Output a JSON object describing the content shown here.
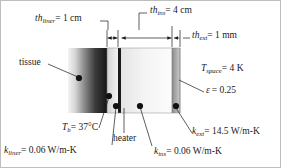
{
  "figure": {
    "type": "engineering-cross-section-diagram",
    "background_color": "#ffffff",
    "line_color": "#1a1a1a"
  },
  "layers": [
    {
      "name": "tissue",
      "label": "tissue",
      "x0": 68,
      "x1": 107,
      "fill_from": "#f2f2f2",
      "fill_to": "#1c1c1c"
    },
    {
      "name": "liner",
      "label": "liner",
      "x0": 107,
      "x1": 118,
      "fill_from": "#d9d9d9",
      "fill_to": "#efefef"
    },
    {
      "name": "heater",
      "label": "heater",
      "x0": 118,
      "x1": 121,
      "fill_from": "#191919",
      "fill_to": "#191919"
    },
    {
      "name": "insulation",
      "label": "ins",
      "x0": 121,
      "x1": 172,
      "fill_from": "#e8e8e8",
      "fill_to": "#fafafa"
    },
    {
      "name": "exterior",
      "label": "ext",
      "x0": 172,
      "x1": 180,
      "fill_from": "#8f8f8f",
      "fill_to": "#c9c9c9"
    }
  ],
  "dimensions": {
    "liner": {
      "symbol": "th",
      "subscript": "liner",
      "equals": "= 1 cm",
      "full_text": "th_liner = 1 cm"
    },
    "ins": {
      "symbol": "th",
      "subscript": "ins",
      "equals": "= 4 cm",
      "full_text": "th_ins = 4 cm"
    },
    "ext": {
      "symbol": "th",
      "subscript": "ext",
      "equals": "= 1 mm",
      "full_text": "th_ext = 1 mm"
    }
  },
  "callouts": {
    "tissue": {
      "text": "tissue"
    },
    "heater": {
      "text": "heater"
    },
    "body_temperature": {
      "symbol": "T",
      "subscript": "b",
      "equals": "= 37°C",
      "full_text": "T_b = 37°C"
    },
    "space_temperature": {
      "symbol": "T",
      "subscript": "space",
      "equals": "= 4 K",
      "full_text": "T_space = 4 K"
    },
    "emissivity": {
      "symbol": "ε",
      "subscript": "",
      "equals": "= 0.25",
      "full_text": "ε = 0.25"
    },
    "k_liner": {
      "symbol": "k",
      "subscript": "liner",
      "equals": "= 0.06 W/m-K",
      "full_text": "k_liner = 0.06 W/m-K"
    },
    "k_ins": {
      "symbol": "k",
      "subscript": "ins",
      "equals": "= 0.06 W/m-K",
      "full_text": "k_ins = 0.06 W/m-K"
    },
    "k_ext": {
      "symbol": "k",
      "subscript": "ext",
      "equals": "= 14.5 W/m-K",
      "full_text": "k_ext = 14.5 W/m-K"
    }
  }
}
